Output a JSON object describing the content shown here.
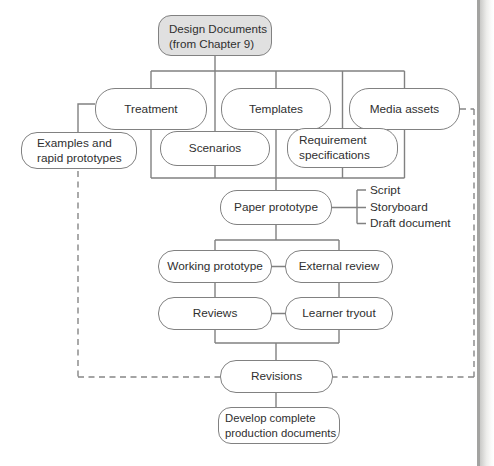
{
  "diagram": {
    "nodes": {
      "design_documents": "Design Documents\n(from Chapter 9)",
      "treatment": "Treatment",
      "templates": "Templates",
      "media_assets": "Media assets",
      "examples": "Examples and\nrapid prototypes",
      "scenarios": "Scenarios",
      "requirement_specifications": "Requirement\nspecifications",
      "paper_prototype": "Paper prototype",
      "working_prototype": "Working prototype",
      "external_review": "External review",
      "reviews": "Reviews",
      "learner_tryout": "Learner tryout",
      "revisions": "Revisions",
      "develop_complete": "Develop complete\nproduction documents"
    },
    "side_labels": {
      "script": "Script",
      "storyboard": "Storyboard",
      "draft_document": "Draft document"
    },
    "colors": {
      "line": "#818181",
      "text": "#2f2f2f",
      "node_fill": "#ffffff",
      "start_node_fill": "#e0e0e0",
      "background": "#ffffff",
      "page_edge": "#a3a3a1"
    }
  }
}
